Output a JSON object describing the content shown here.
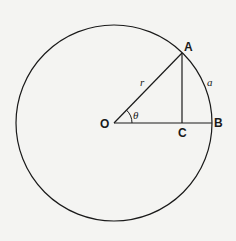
{
  "diagram": {
    "type": "geometry",
    "colors": {
      "stroke": "#1a1a1a",
      "background": "#f4f4f2"
    },
    "circle": {
      "cx": 114,
      "cy": 123,
      "r": 98
    },
    "points": {
      "O": {
        "label": "O",
        "x": 114,
        "y": 123
      },
      "A": {
        "label": "A",
        "x": 182,
        "y": 53
      },
      "B": {
        "label": "B",
        "x": 212,
        "y": 123
      },
      "C": {
        "label": "C",
        "x": 182,
        "y": 123
      }
    },
    "labels": {
      "radius": "r",
      "angle": "θ",
      "arc": "a"
    }
  }
}
